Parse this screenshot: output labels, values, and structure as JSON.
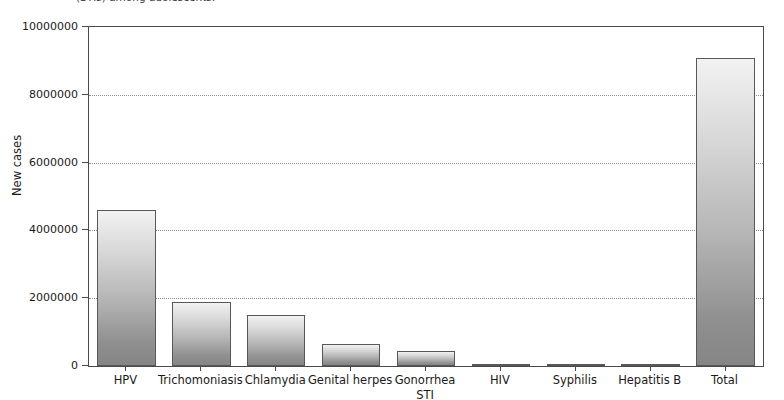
{
  "caption": {
    "text": "(STIs) among adolescents."
  },
  "chart_data": {
    "type": "bar",
    "title": "",
    "xlabel": "STI",
    "ylabel": "New cases",
    "categories": [
      "HPV",
      "Trichomoniasis",
      "Chlamydia",
      "Genital herpes",
      "Gonorrhea",
      "HIV",
      "Syphilis",
      "Hepatitis B",
      "Total"
    ],
    "values": [
      4600000,
      1900000,
      1500000,
      640000,
      450000,
      60000,
      25000,
      15000,
      9100000
    ],
    "ylim": [
      0,
      10000000
    ],
    "ytick_labels": [
      "0",
      "2000000",
      "4000000",
      "6000000",
      "8000000",
      "10000000"
    ],
    "ytick_values": [
      0,
      2000000,
      4000000,
      6000000,
      8000000,
      10000000
    ],
    "grid": true,
    "legend": "none",
    "bar_fill_top": "#f2f2f2",
    "bar_fill_bottom": "#858585",
    "bar_edge_color": "#585858",
    "axis_color": "#4a4a4a",
    "grid_color": "#8d8d8d"
  }
}
